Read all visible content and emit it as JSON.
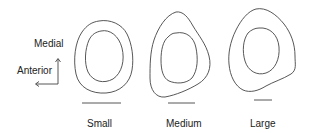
{
  "orientation": {
    "medial_label": "Medial",
    "anterior_label": "Anterior"
  },
  "sections": [
    {
      "label": "Small"
    },
    {
      "label": "Medium"
    },
    {
      "label": "Large"
    }
  ],
  "colors": {
    "stroke": "#444444",
    "text": "#222222",
    "background": "#ffffff"
  }
}
